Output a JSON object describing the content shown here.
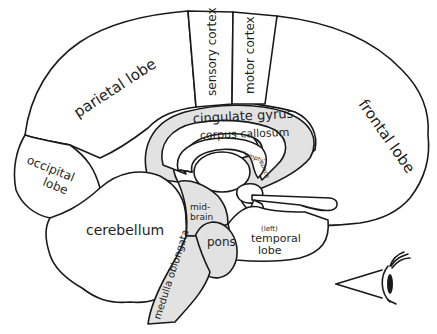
{
  "diagram": {
    "type": "brain-sagittal-section",
    "colors": {
      "outline": "#1a1a1a",
      "shaded": "#e2e2e2",
      "background": "#ffffff"
    },
    "labels": {
      "parietal": "parietal lobe",
      "sensory": "sensory cortex",
      "motor": "motor cortex",
      "frontal": "frontal lobe",
      "occipital_1": "occipital",
      "occipital_2": "lobe",
      "cingulate": "cingulate gyrus",
      "corpus": "corpus callosum",
      "empty": "\"empty\"",
      "space": "space",
      "cerebellum": "cerebellum",
      "midbrain_1": "mid-",
      "midbrain_2": "brain",
      "pons": "pons",
      "temporal_left": "(left)",
      "temporal_1": "temporal",
      "temporal_2": "lobe",
      "medulla": "medulla oblongata"
    },
    "icons": [
      "eye-icon"
    ]
  }
}
